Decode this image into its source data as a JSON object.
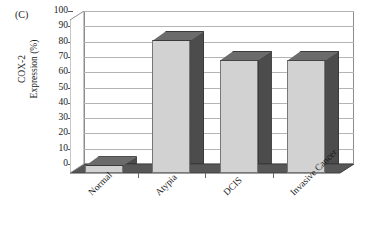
{
  "panel": {
    "label": "(C)"
  },
  "chart_data": {
    "type": "bar",
    "title": "",
    "subtitle": "",
    "panel_label": "(C)",
    "xlabel": "",
    "ylabel": "COX-2 Expression (%)",
    "ylabel_lines": [
      "COX-2",
      "Expression (%)"
    ],
    "categories": [
      "Normal",
      "Atypia",
      "DCIS",
      "Invasive Cancer"
    ],
    "values": [
      5,
      87,
      74,
      74
    ],
    "series": [
      {
        "name": "COX-2 Expression",
        "values": [
          5,
          87,
          74,
          74
        ]
      }
    ],
    "ylim": [
      0,
      100
    ],
    "ytick_values": [
      0,
      10,
      20,
      30,
      40,
      50,
      60,
      70,
      80,
      90,
      100
    ],
    "ytick_labels": [
      "0",
      "10",
      "20",
      "30",
      "40",
      "50",
      "60",
      "70",
      "80",
      "90",
      "100"
    ],
    "ytick_step": 10,
    "grid": true,
    "grid_axis": "y",
    "legend": false,
    "legend_position": "none",
    "style": "3d-column",
    "xtick_label_rotation": -45,
    "colors": {
      "bar_front": "#d2d2d2",
      "bar_side": "#4c4c4c",
      "bar_top": "#6b6b6b",
      "floor": "#575757",
      "back_wall": "#ffffff",
      "gridline": "#b4b4b4",
      "axis": "#8d8d8d",
      "text": "#1a1a1a",
      "background": "#ffffff"
    }
  }
}
